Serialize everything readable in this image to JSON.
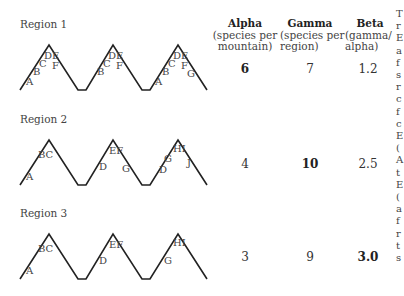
{
  "columns": [
    {
      "title": "Alpha",
      "subtitle_lines": [
        "(species per",
        "mountain)"
      ]
    },
    {
      "title": "Gamma",
      "subtitle_lines": [
        "(species per",
        "region)"
      ]
    },
    {
      "title": "Beta",
      "subtitle_lines": [
        "(gamma/",
        "alpha)"
      ]
    }
  ],
  "regions": [
    {
      "label": "Region 1",
      "alpha": "6",
      "gamma": "7",
      "beta": "1.2",
      "bold": "alpha",
      "mountains": [
        {
          "labels": [
            "A",
            "B",
            "C",
            "DE",
            "F"
          ]
        },
        {
          "labels": [
            "B",
            "C",
            "DE",
            "F"
          ]
        },
        {
          "labels": [
            "A",
            "B",
            "C",
            "DE",
            "F",
            "G"
          ]
        }
      ]
    },
    {
      "label": "Region 2",
      "alpha": "4",
      "gamma": "10",
      "beta": "2.5",
      "bold": "gamma",
      "mountains": [
        {
          "labels": [
            "A",
            "BC"
          ]
        },
        {
          "labels": [
            "D",
            "EF",
            "G"
          ]
        },
        {
          "labels": [
            "D",
            "G",
            "HI",
            "J"
          ]
        }
      ]
    },
    {
      "label": "Region 3",
      "alpha": "3",
      "gamma": "9",
      "beta": "3.0",
      "bold": "beta",
      "mountains": [
        {
          "labels": [
            "A",
            "BC"
          ]
        },
        {
          "labels": [
            "D",
            "EF"
          ]
        },
        {
          "labels": [
            "G",
            "HI"
          ]
        }
      ]
    }
  ],
  "cut_off_text": [
    "T",
    "r",
    "E",
    "a",
    "f",
    "s",
    "r",
    "c",
    "f",
    "c",
    "E",
    "(",
    "A",
    "t",
    "E",
    "(",
    "a",
    "f",
    "r",
    "t",
    "s"
  ]
}
